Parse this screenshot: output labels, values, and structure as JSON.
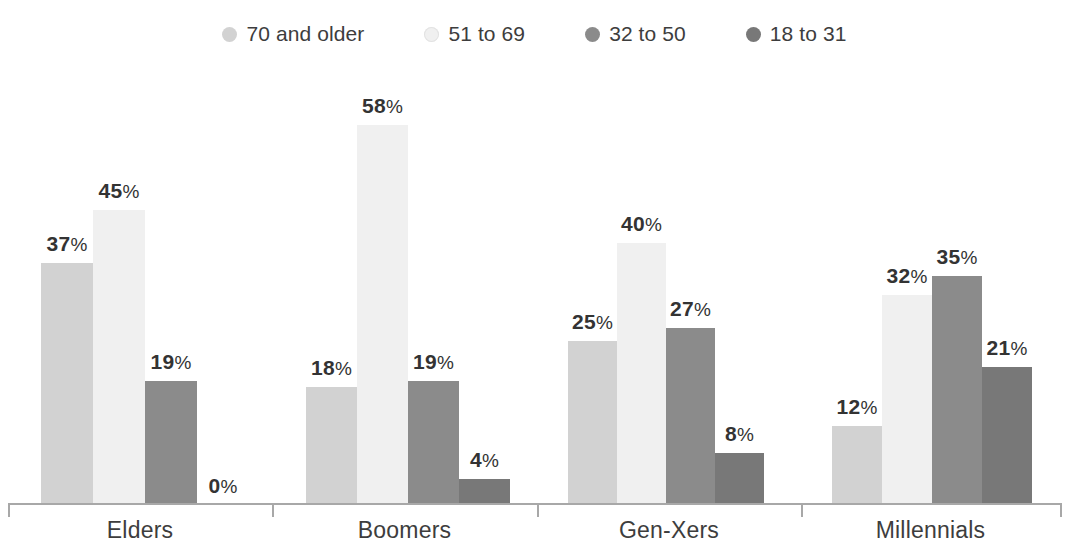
{
  "legend": {
    "position": "top-center",
    "items": [
      {
        "label": "70 and older",
        "color": "#d2d2d2",
        "swatch": "legend-dot-70-and-older"
      },
      {
        "label": "51 to 69",
        "color": "#f0f0f0",
        "swatch": "legend-dot-51-to-69"
      },
      {
        "label": "32 to 50",
        "color": "#8b8b8b",
        "swatch": "legend-dot-32-to-50"
      },
      {
        "label": "18 to 31",
        "color": "#787878",
        "swatch": "legend-dot-18-to-31"
      }
    ]
  },
  "axis": {
    "categories": [
      "Elders",
      "Boomers",
      "Gen-Xers",
      "Millennials"
    ]
  },
  "labels": {
    "elders": [
      "37%",
      "45%",
      "19%",
      "0%"
    ],
    "boomers": [
      "18%",
      "58%",
      "19%",
      "4%"
    ],
    "genxers": [
      "25%",
      "40%",
      "27%",
      "8%"
    ],
    "millennials": [
      "12%",
      "32%",
      "35%",
      "21%"
    ]
  },
  "chart_data": {
    "type": "bar",
    "title": "",
    "subtitle": "",
    "xlabel": "",
    "ylabel": "",
    "ylim": [
      0,
      58
    ],
    "grid": false,
    "legend_position": "top-center",
    "value_labels": true,
    "value_label_suffix": "%",
    "categories": [
      "Elders",
      "Boomers",
      "Gen-Xers",
      "Millennials"
    ],
    "series": [
      {
        "name": "70 and older",
        "color": "#d2d2d2",
        "values": [
          37,
          18,
          25,
          12
        ]
      },
      {
        "name": "51 to 69",
        "color": "#f0f0f0",
        "values": [
          45,
          58,
          40,
          32
        ]
      },
      {
        "name": "32 to 50",
        "color": "#8b8b8b",
        "values": [
          19,
          19,
          27,
          35
        ]
      },
      {
        "name": "18 to 31",
        "color": "#787878",
        "values": [
          0,
          4,
          8,
          21
        ]
      }
    ]
  }
}
